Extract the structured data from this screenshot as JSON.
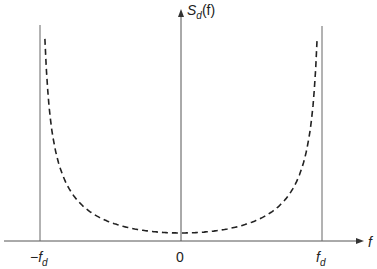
{
  "chart_data": {
    "type": "line",
    "title": "",
    "ylabel": "S_d(f)",
    "xlabel": "f",
    "x_ticks": [
      "-f_d",
      "0",
      "f_d"
    ],
    "xlim": [
      -1.0,
      1.0
    ],
    "series": [
      {
        "name": "S_d(f)",
        "style": "dashed",
        "formula": "1/sqrt(1-(f/f_d)^2)",
        "x": [
          -0.99,
          -0.95,
          -0.9,
          -0.8,
          -0.6,
          -0.4,
          -0.2,
          0,
          0.2,
          0.4,
          0.6,
          0.8,
          0.9,
          0.95,
          0.99
        ],
        "y": [
          7.09,
          3.2,
          2.29,
          1.67,
          1.25,
          1.09,
          1.02,
          1.0,
          1.02,
          1.09,
          1.25,
          1.67,
          2.29,
          3.2,
          7.09
        ]
      }
    ],
    "vertical_lines": [
      "-f_d",
      "f_d"
    ],
    "grid": false
  },
  "labels": {
    "y_axis": {
      "main": "S",
      "sub": "d",
      "arg": "(f)"
    },
    "x_axis": "f",
    "tick_neg": {
      "main": "−f",
      "sub": "d"
    },
    "tick_zero": "0",
    "tick_pos": {
      "main": "f",
      "sub": "d"
    }
  }
}
